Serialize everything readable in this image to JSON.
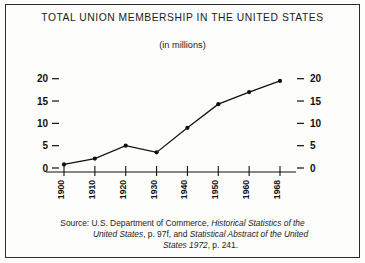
{
  "chart_data": {
    "type": "line",
    "title": "TOTAL UNION MEMBERSHIP IN THE UNITED STATES",
    "subtitle": "(in millions)",
    "xlabel": "",
    "ylabel": "",
    "categories": [
      "1900",
      "1910",
      "1920",
      "1930",
      "1940",
      "1950",
      "1960",
      "1968"
    ],
    "x": [
      1900,
      1910,
      1920,
      1930,
      1940,
      1950,
      1960,
      1968
    ],
    "values": [
      0.8,
      2.1,
      5.0,
      3.5,
      9.0,
      14.3,
      17.0,
      19.5
    ],
    "ylim": [
      0,
      21.5
    ],
    "yticks": [
      0,
      5,
      10,
      15,
      20
    ],
    "ytick_labels": [
      "0",
      "5",
      "10",
      "15",
      "20"
    ],
    "ytick_labels_right": [
      "0",
      "5",
      "10",
      "15",
      "20"
    ],
    "xtick_labels": [
      "1900",
      "1910",
      "1920",
      "1930",
      "1940",
      "1950",
      "1960",
      "1968"
    ],
    "grid": false,
    "legend": null,
    "marker": "filled-circle",
    "line_color": "#111111",
    "axis_color": "#111111"
  },
  "source": {
    "line1_prefix": "Source: U.S. Department of Commerce, ",
    "line1_italic": "Historical Statistics of the",
    "line2_italic_a": "United States",
    "line2_mid": ",  p. 97f, and ",
    "line2_italic_b": "Statistical Abstract of the United",
    "line3_italic": "States 1972",
    "line3_suffix": ", p. 241."
  }
}
